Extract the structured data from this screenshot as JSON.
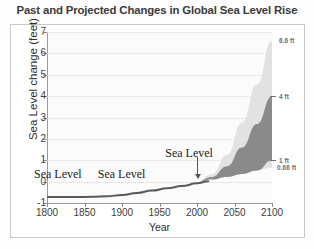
{
  "figure": {
    "title": "Past and Projected Changes in Global Sea Level Rise"
  },
  "chart_data": {
    "type": "area",
    "title": "Past and Projected Changes in Global Sea Level Rise",
    "xlabel": "Year",
    "ylabel": "Sea Level change (feet)",
    "xlim": [
      1800,
      2100
    ],
    "ylim": [
      -1,
      7
    ],
    "grid": true,
    "legend_position": "none",
    "xticks": [
      1800,
      1850,
      1900,
      1950,
      2000,
      2050,
      2100
    ],
    "xticklabels": [
      "1800",
      "1850",
      "1900",
      "1950",
      "2000",
      "2050",
      "2100"
    ],
    "yticks": [
      -1,
      0,
      1,
      2,
      3,
      4,
      5,
      6,
      7
    ],
    "yticklabels": [
      "-1",
      "0",
      "1",
      "2",
      "3",
      "4",
      "5",
      "6",
      "7"
    ],
    "series": [
      {
        "name": "Observed sea level",
        "type": "line",
        "color": "#5a5a5a",
        "x": [
          1800,
          1820,
          1840,
          1860,
          1880,
          1900,
          1920,
          1940,
          1960,
          1980,
          2000,
          2015
        ],
        "values": [
          -0.72,
          -0.72,
          -0.72,
          -0.71,
          -0.69,
          -0.62,
          -0.53,
          -0.42,
          -0.31,
          -0.21,
          -0.08,
          0.02
        ]
      },
      {
        "name": "Projected range (full envelope)",
        "type": "area",
        "color": "#e2e2e2",
        "x": [
          2000,
          2020,
          2040,
          2060,
          2080,
          2100
        ],
        "upper": [
          0.0,
          0.35,
          1.25,
          2.75,
          4.55,
          6.6
        ],
        "lower": [
          0.0,
          0.1,
          0.22,
          0.36,
          0.52,
          0.66
        ]
      },
      {
        "name": "Projected range (intermediate)",
        "type": "area",
        "color": "#8a8a8a",
        "x": [
          2000,
          2020,
          2040,
          2060,
          2080,
          2100
        ],
        "upper": [
          0.0,
          0.22,
          0.72,
          1.6,
          2.7,
          4.0
        ],
        "lower": [
          0.0,
          0.1,
          0.22,
          0.36,
          0.52,
          1.0
        ]
      }
    ],
    "annotations": [
      {
        "text": "Sea Level",
        "x": 1820,
        "y": 0.35
      },
      {
        "text": "Sea Level",
        "x": 1905,
        "y": 0.35
      },
      {
        "text": "Sea Level",
        "x": 1995,
        "y": 1.35,
        "arrow_to_x": 2000,
        "arrow_to_y": 0.1
      }
    ],
    "scenario_labels": [
      {
        "label": "6.6 ft",
        "value": 6.6
      },
      {
        "label": "4 ft",
        "value": 4.0
      },
      {
        "label": "1 ft",
        "value": 1.0
      },
      {
        "label": "0.66 ft",
        "value": 0.66
      }
    ]
  }
}
